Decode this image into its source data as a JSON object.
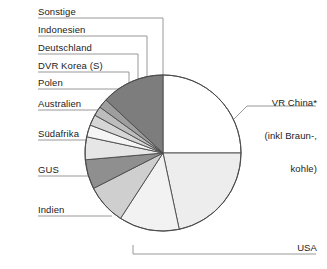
{
  "chart_data": {
    "type": "pie",
    "title": "",
    "xlabel": "",
    "ylabel": "",
    "legend_position": "callout-labels",
    "grid": false,
    "unit": "share of total (percent, estimated from slice angles)",
    "categories": [
      "VR China* (inkl Braun-, kohle)",
      "USA",
      "Indien",
      "GUS",
      "Südafrika",
      "Australien",
      "Polen",
      "DVR Korea (S)",
      "Deutschland",
      "Indonesien",
      "Sonstige"
    ],
    "values": [
      25.0,
      21.7,
      12.5,
      8.3,
      6.1,
      4.7,
      2.5,
      2.2,
      1.9,
      1.9,
      13.2
    ],
    "angles_deg": [
      90.0,
      78.0,
      45.0,
      30.0,
      22.0,
      17.0,
      9.0,
      8.0,
      7.0,
      7.0,
      47.0
    ],
    "colors": [
      "#ffffff",
      "#ededed",
      "#f2f2f2",
      "#cfcfcf",
      "#8f8f8f",
      "#e6e6e6",
      "#f5f5f5",
      "#d6d6d6",
      "#bdbdbd",
      "#9e9e9e",
      "#7d7d7d"
    ],
    "slices": [
      {
        "label": "VR China*",
        "label_line2": "(inkl Braun-,",
        "label_line3": "kohle)",
        "value": 25.0,
        "color": "#ffffff"
      },
      {
        "label": "USA",
        "value": 21.7,
        "color": "#ededed"
      },
      {
        "label": "Indien",
        "value": 12.5,
        "color": "#f2f2f2"
      },
      {
        "label": "GUS",
        "value": 8.3,
        "color": "#cfcfcf"
      },
      {
        "label": "Südafrika",
        "value": 6.1,
        "color": "#8f8f8f"
      },
      {
        "label": "Australien",
        "value": 4.7,
        "color": "#e6e6e6"
      },
      {
        "label": "Polen",
        "value": 2.5,
        "color": "#f5f5f5"
      },
      {
        "label": "DVR Korea (S)",
        "value": 2.2,
        "color": "#d6d6d6"
      },
      {
        "label": "Deutschland",
        "value": 1.9,
        "color": "#bdbdbd"
      },
      {
        "label": "Indonesien",
        "value": 1.9,
        "color": "#9e9e9e"
      },
      {
        "label": "Sonstige",
        "value": 13.2,
        "color": "#7d7d7d"
      }
    ]
  },
  "labels": {
    "sonstige": "Sonstige",
    "indonesien": "Indonesien",
    "deutschland": "Deutschland",
    "dvr_korea": "DVR Korea (S)",
    "polen": "Polen",
    "australien": "Australien",
    "suedafrika": "Südafrika",
    "gus": "GUS",
    "indien": "Indien",
    "usa": "USA",
    "vr_china_l1": "VR China*",
    "vr_china_l2": "(inkl Braun-,",
    "vr_china_l3": "kohle)"
  },
  "style": {
    "slice_stroke": "#4a4a4a",
    "leader_stroke": "#8c8c8c",
    "text_color": "#222222",
    "background": "#ffffff"
  }
}
